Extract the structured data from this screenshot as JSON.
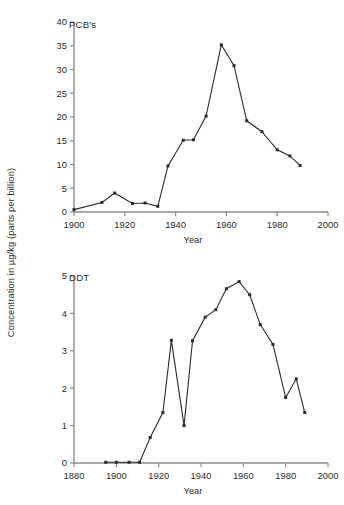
{
  "figure": {
    "y_axis_label": "Concentration in µg/kg (parts per billion)",
    "background_color": "#ffffff",
    "line_color": "#2b2b2b",
    "axis_color": "#8c8c8c"
  },
  "chart_data": [
    {
      "type": "line",
      "title": "PCB's",
      "series_label": "PCB's",
      "xlabel": "Year",
      "ylabel": "Concentration in µg/kg (parts per billion)",
      "xlim": [
        1900,
        2000
      ],
      "ylim": [
        0,
        40
      ],
      "xticks": [
        1900,
        1920,
        1940,
        1960,
        1980,
        2000
      ],
      "xticklabels": [
        "1900",
        "1920",
        "1940",
        "1960",
        "1980",
        "2000"
      ],
      "yticks": [
        0,
        5,
        10,
        15,
        20,
        25,
        30,
        35,
        40
      ],
      "yticklabels": [
        "0",
        "5",
        "10",
        "15",
        "20",
        "25",
        "30",
        "35",
        "40"
      ],
      "grid": false,
      "legend": false,
      "markers": "filled-square",
      "x": [
        1900,
        1911,
        1916,
        1923,
        1928,
        1933,
        1937,
        1943,
        1947,
        1952,
        1958,
        1963,
        1968,
        1974,
        1980,
        1985,
        1989
      ],
      "values": [
        0.5,
        2.0,
        4.0,
        1.8,
        1.9,
        1.2,
        9.7,
        15.1,
        15.2,
        20.2,
        35.2,
        30.8,
        19.2,
        16.9,
        13.1,
        11.8,
        9.8
      ]
    },
    {
      "type": "line",
      "title": "DDT",
      "series_label": "DDT",
      "xlabel": "Year",
      "ylabel": "Concentration in µg/kg (parts per billion)",
      "xlim": [
        1880,
        2000
      ],
      "ylim": [
        0,
        5
      ],
      "xticks": [
        1880,
        1900,
        1920,
        1940,
        1960,
        1980,
        2000
      ],
      "xticklabels": [
        "1880",
        "1900",
        "1920",
        "1940",
        "1960",
        "1980",
        "2000"
      ],
      "yticks": [
        0,
        1,
        2,
        3,
        4,
        5
      ],
      "yticklabels": [
        "0",
        "1",
        "2",
        "3",
        "4",
        "5"
      ],
      "grid": false,
      "legend": false,
      "markers": "filled-square",
      "x": [
        1895,
        1900,
        1906,
        1911,
        1916,
        1922,
        1926,
        1932,
        1936,
        1942,
        1947,
        1952,
        1958,
        1963,
        1968,
        1974,
        1980,
        1985,
        1989
      ],
      "values": [
        0.02,
        0.02,
        0.02,
        0.02,
        0.68,
        1.35,
        3.28,
        1.0,
        3.27,
        3.9,
        4.1,
        4.66,
        4.85,
        4.5,
        3.7,
        3.17,
        1.75,
        2.25,
        1.35
      ]
    }
  ]
}
